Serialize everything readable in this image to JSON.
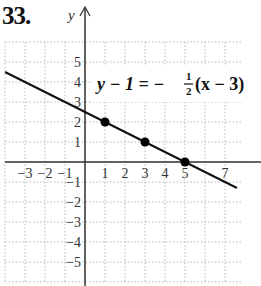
{
  "problem": {
    "number": "33."
  },
  "chart_data": {
    "type": "line",
    "title": "",
    "equation": {
      "lhs": "y − 1 = −",
      "frac_num": "1",
      "frac_den": "2",
      "rhs": "(x − 3)",
      "full": "y − 1 = −1/2(x − 3)"
    },
    "xlabel": "",
    "ylabel": "y",
    "xlim": [
      -4,
      8
    ],
    "ylim": [
      -6,
      6
    ],
    "grid": true,
    "x_tick_labels": [
      "−3",
      "−2",
      "−1",
      "1",
      "2",
      "3",
      "4",
      "5",
      "7"
    ],
    "x_tick_values": [
      -3,
      -2,
      -1,
      1,
      2,
      3,
      4,
      5,
      7
    ],
    "y_tick_labels": [
      "5",
      "4",
      "3",
      "2",
      "1",
      "−1",
      "−2",
      "−3",
      "−4",
      "−5"
    ],
    "y_tick_values": [
      5,
      4,
      3,
      2,
      1,
      -1,
      -2,
      -3,
      -4,
      -5
    ],
    "line": {
      "slope": -0.5,
      "intercept": 2.5,
      "x_start": -4,
      "x_end": 7.6
    },
    "points": [
      {
        "x": 1,
        "y": 2
      },
      {
        "x": 3,
        "y": 1
      },
      {
        "x": 5,
        "y": 0
      }
    ],
    "colors": {
      "line": "#111111",
      "grid": "#b8b8b8",
      "axis": "#333333"
    }
  }
}
